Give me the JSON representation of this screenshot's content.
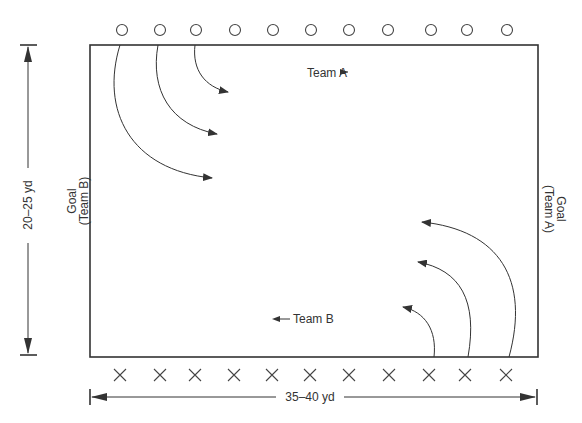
{
  "diagram": {
    "field_label_team_a": "Team A",
    "field_label_team_b": "Team B",
    "goal_left_line1": "Goal",
    "goal_left_line2": "(Team B)",
    "goal_right_line1": "Goal",
    "goal_right_line2": "(Team A)",
    "height_dimension": "20–25 yd",
    "width_dimension": "35–40 yd",
    "team_a_marker": "circle",
    "team_b_marker": "cross",
    "team_a_players": 11,
    "team_b_players": 11,
    "colors": {
      "ink": "#333333",
      "background": "#ffffff"
    }
  }
}
